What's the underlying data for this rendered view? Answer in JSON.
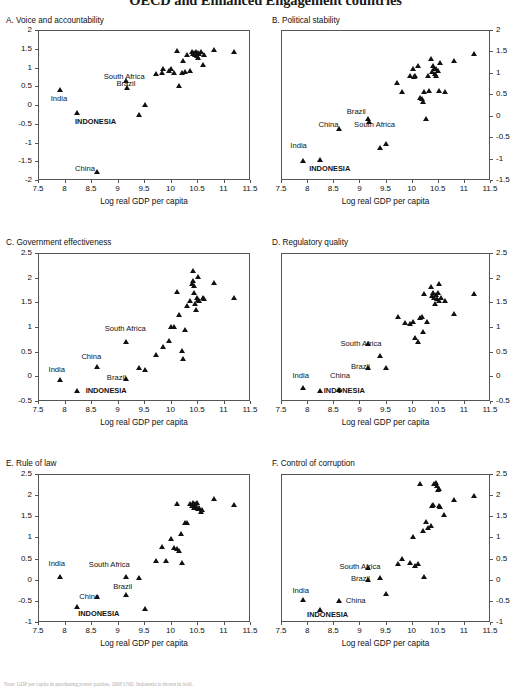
{
  "figure": {
    "title": "OECD and Enhanced Engagement countries",
    "note": "Note: GDP per capita in purchasing power parities, 2008 USD. Indonesia is shown in bold.",
    "xlabel": "Log real GDP per capita",
    "xlim": [
      7.5,
      11.5
    ],
    "xticks": [
      "7.5",
      "8",
      "8.5",
      "9",
      "9.5",
      "10",
      "10.5",
      "11",
      "11.5"
    ],
    "marker_color": "#111111"
  },
  "chart_data": [
    {
      "type": "scatter",
      "panel": "A",
      "title": "A. Voice and accountability",
      "xlabel": "Log real GDP per capita",
      "ylabel": "",
      "xlim": [
        7.5,
        11.5
      ],
      "ylim": [
        -2,
        2
      ],
      "yticks": [
        "-2",
        "-1.5",
        "-1",
        "-0.5",
        "0",
        "0.5",
        "1",
        "1.5",
        "2"
      ],
      "y_axis_side": "left",
      "grid": false,
      "legend": "none",
      "points": [
        [
          7.9,
          0.43
        ],
        [
          8.22,
          -0.17
        ],
        [
          8.6,
          -1.74
        ],
        [
          9.15,
          0.68
        ],
        [
          9.17,
          0.48
        ],
        [
          9.38,
          -0.22
        ],
        [
          9.5,
          0.03
        ],
        [
          9.7,
          0.85
        ],
        [
          9.82,
          0.88
        ],
        [
          9.85,
          1.0
        ],
        [
          9.95,
          0.95
        ],
        [
          10.0,
          1.0
        ],
        [
          10.05,
          0.88
        ],
        [
          10.1,
          1.47
        ],
        [
          10.15,
          0.55
        ],
        [
          10.2,
          0.9
        ],
        [
          10.22,
          1.2
        ],
        [
          10.25,
          0.92
        ],
        [
          10.3,
          1.36
        ],
        [
          10.35,
          0.93
        ],
        [
          10.38,
          1.45
        ],
        [
          10.4,
          1.4
        ],
        [
          10.42,
          1.43
        ],
        [
          10.45,
          1.38
        ],
        [
          10.47,
          1.45
        ],
        [
          10.48,
          1.35
        ],
        [
          10.5,
          1.42
        ],
        [
          10.5,
          1.3
        ],
        [
          10.52,
          1.39
        ],
        [
          10.55,
          1.44
        ],
        [
          10.6,
          1.1
        ],
        [
          10.62,
          1.36
        ],
        [
          10.8,
          1.5
        ],
        [
          11.18,
          1.46
        ]
      ],
      "annotations": [
        {
          "text": "India",
          "x": 7.72,
          "y": 0.18,
          "bold": false
        },
        {
          "text": "South Africa",
          "x": 8.72,
          "y": 0.77,
          "bold": false
        },
        {
          "text": "Brazil",
          "x": 8.96,
          "y": 0.58,
          "bold": false
        },
        {
          "text": "INDONESIA",
          "x": 8.18,
          "y": -0.42,
          "bold": true
        },
        {
          "text": "China",
          "x": 8.18,
          "y": -1.68,
          "bold": false
        }
      ]
    },
    {
      "type": "scatter",
      "panel": "B",
      "title": "B. Political stability",
      "xlabel": "Log real GDP per capita",
      "ylabel": "",
      "xlim": [
        7.5,
        11.5
      ],
      "ylim": [
        -1.5,
        2
      ],
      "yticks": [
        "-1.5",
        "-1",
        "-0.5",
        "0",
        "0.5",
        "1",
        "1.5",
        "2"
      ],
      "y_axis_side": "right",
      "grid": false,
      "legend": "none",
      "points": [
        [
          7.9,
          -1.02
        ],
        [
          8.22,
          -1.0
        ],
        [
          8.6,
          -0.27
        ],
        [
          9.15,
          -0.05
        ],
        [
          9.17,
          -0.12
        ],
        [
          9.38,
          -0.72
        ],
        [
          9.5,
          -0.64
        ],
        [
          9.7,
          0.8
        ],
        [
          9.8,
          0.58
        ],
        [
          9.95,
          0.95
        ],
        [
          10.0,
          1.12
        ],
        [
          10.02,
          0.93
        ],
        [
          10.05,
          0.95
        ],
        [
          10.1,
          1.2
        ],
        [
          10.15,
          0.45
        ],
        [
          10.18,
          0.42
        ],
        [
          10.2,
          0.35
        ],
        [
          10.22,
          0.58
        ],
        [
          10.25,
          -0.05
        ],
        [
          10.3,
          0.95
        ],
        [
          10.32,
          0.6
        ],
        [
          10.35,
          1.35
        ],
        [
          10.38,
          1.05
        ],
        [
          10.4,
          1.18
        ],
        [
          10.42,
          1.12
        ],
        [
          10.43,
          1.0
        ],
        [
          10.45,
          1.13
        ],
        [
          10.45,
          0.95
        ],
        [
          10.48,
          1.08
        ],
        [
          10.5,
          0.6
        ],
        [
          10.52,
          1.25
        ],
        [
          10.62,
          0.58
        ],
        [
          10.8,
          1.3
        ],
        [
          11.18,
          1.48
        ]
      ],
      "annotations": [
        {
          "text": "India",
          "x": 7.66,
          "y": -0.68,
          "bold": false
        },
        {
          "text": "China",
          "x": 8.2,
          "y": -0.2,
          "bold": false
        },
        {
          "text": "Brazil",
          "x": 8.74,
          "y": 0.12,
          "bold": false
        },
        {
          "text": "South Africa",
          "x": 8.88,
          "y": -0.2,
          "bold": false
        },
        {
          "text": "INDONESIA",
          "x": 8.02,
          "y": -1.22,
          "bold": true
        }
      ]
    },
    {
      "type": "scatter",
      "panel": "C",
      "title": "C. Government effectiveness",
      "xlabel": "Log real GDP per capita",
      "ylabel": "",
      "xlim": [
        7.5,
        11.5
      ],
      "ylim": [
        -0.5,
        2.5
      ],
      "yticks": [
        "-0.5",
        "0",
        "0.5",
        "1",
        "1.5",
        "2",
        "2.5"
      ],
      "y_axis_side": "left",
      "grid": false,
      "legend": "none",
      "points": [
        [
          7.9,
          -0.04
        ],
        [
          8.22,
          -0.28
        ],
        [
          8.6,
          0.22
        ],
        [
          9.15,
          0.73
        ],
        [
          9.15,
          -0.03
        ],
        [
          9.38,
          0.19
        ],
        [
          9.5,
          0.16
        ],
        [
          9.7,
          0.46
        ],
        [
          9.85,
          0.63
        ],
        [
          9.95,
          0.74
        ],
        [
          10.0,
          1.02
        ],
        [
          10.05,
          1.03
        ],
        [
          10.1,
          1.74
        ],
        [
          10.15,
          1.27
        ],
        [
          10.2,
          0.53
        ],
        [
          10.22,
          0.37
        ],
        [
          10.25,
          0.97
        ],
        [
          10.3,
          1.45
        ],
        [
          10.35,
          1.55
        ],
        [
          10.38,
          1.9
        ],
        [
          10.4,
          2.16
        ],
        [
          10.4,
          1.95
        ],
        [
          10.42,
          1.85
        ],
        [
          10.43,
          1.72
        ],
        [
          10.45,
          1.5
        ],
        [
          10.47,
          1.38
        ],
        [
          10.48,
          1.62
        ],
        [
          10.5,
          2.03
        ],
        [
          10.5,
          1.58
        ],
        [
          10.52,
          1.55
        ],
        [
          10.6,
          1.62
        ],
        [
          10.62,
          1.6
        ],
        [
          10.8,
          1.92
        ],
        [
          11.18,
          1.62
        ]
      ],
      "annotations": [
        {
          "text": "India",
          "x": 7.68,
          "y": 0.14,
          "bold": false
        },
        {
          "text": "China",
          "x": 8.3,
          "y": 0.42,
          "bold": false
        },
        {
          "text": "South Africa",
          "x": 8.74,
          "y": 0.97,
          "bold": false
        },
        {
          "text": "Brazil",
          "x": 8.78,
          "y": -0.02,
          "bold": false
        },
        {
          "text": "INDONESIA",
          "x": 8.38,
          "y": -0.27,
          "bold": true
        }
      ]
    },
    {
      "type": "scatter",
      "panel": "D",
      "title": "D. Regulatory quality",
      "xlabel": "Log real GDP per capita",
      "ylabel": "",
      "xlim": [
        7.5,
        11.5
      ],
      "ylim": [
        -0.5,
        2.5
      ],
      "yticks": [
        "-0.5",
        "0",
        "0.5",
        "1",
        "1.5",
        "2",
        "2.5"
      ],
      "y_axis_side": "right",
      "grid": false,
      "legend": "none",
      "points": [
        [
          7.9,
          -0.22
        ],
        [
          8.22,
          -0.27
        ],
        [
          8.6,
          -0.25
        ],
        [
          9.15,
          0.68
        ],
        [
          9.15,
          0.2
        ],
        [
          9.38,
          0.43
        ],
        [
          9.5,
          0.2
        ],
        [
          9.72,
          1.22
        ],
        [
          9.85,
          1.1
        ],
        [
          9.95,
          1.08
        ],
        [
          10.0,
          1.12
        ],
        [
          10.05,
          0.8
        ],
        [
          10.1,
          0.72
        ],
        [
          10.15,
          1.2
        ],
        [
          10.18,
          1.22
        ],
        [
          10.2,
          0.92
        ],
        [
          10.22,
          1.7
        ],
        [
          10.28,
          1.12
        ],
        [
          10.35,
          1.83
        ],
        [
          10.38,
          1.65
        ],
        [
          10.4,
          1.72
        ],
        [
          10.42,
          1.62
        ],
        [
          10.43,
          1.5
        ],
        [
          10.45,
          1.68
        ],
        [
          10.47,
          1.6
        ],
        [
          10.48,
          1.72
        ],
        [
          10.5,
          1.9
        ],
        [
          10.5,
          1.55
        ],
        [
          10.55,
          1.62
        ],
        [
          10.62,
          1.55
        ],
        [
          10.8,
          1.3
        ],
        [
          11.18,
          1.7
        ]
      ],
      "annotations": [
        {
          "text": "South Africa",
          "x": 8.62,
          "y": 0.68,
          "bold": false
        },
        {
          "text": "Brazil",
          "x": 8.82,
          "y": 0.21,
          "bold": false
        },
        {
          "text": "India",
          "x": 7.7,
          "y": 0.02,
          "bold": false
        },
        {
          "text": "China",
          "x": 8.42,
          "y": 0.02,
          "bold": false
        },
        {
          "text": "INDONESIA",
          "x": 8.3,
          "y": -0.27,
          "bold": true
        }
      ]
    },
    {
      "type": "scatter",
      "panel": "E",
      "title": "E. Rule of law",
      "xlabel": "Log real GDP per capita",
      "ylabel": "",
      "xlim": [
        7.5,
        11.5
      ],
      "ylim": [
        -1,
        2.5
      ],
      "yticks": [
        "-1",
        "-0.5",
        "0",
        "0.5",
        "1",
        "1.5",
        "2",
        "2.5"
      ],
      "y_axis_side": "left",
      "grid": false,
      "legend": "none",
      "points": [
        [
          7.9,
          0.1
        ],
        [
          8.22,
          -0.62
        ],
        [
          8.6,
          -0.37
        ],
        [
          9.15,
          0.09
        ],
        [
          9.15,
          -0.33
        ],
        [
          9.38,
          0.06
        ],
        [
          9.5,
          -0.66
        ],
        [
          9.7,
          0.47
        ],
        [
          9.82,
          0.8
        ],
        [
          9.9,
          0.47
        ],
        [
          10.0,
          1.0
        ],
        [
          10.05,
          0.78
        ],
        [
          10.1,
          0.75
        ],
        [
          10.1,
          1.83
        ],
        [
          10.15,
          0.72
        ],
        [
          10.18,
          1.12
        ],
        [
          10.2,
          0.43
        ],
        [
          10.25,
          1.37
        ],
        [
          10.3,
          1.38
        ],
        [
          10.35,
          1.82
        ],
        [
          10.38,
          1.78
        ],
        [
          10.4,
          1.85
        ],
        [
          10.42,
          1.8
        ],
        [
          10.43,
          1.73
        ],
        [
          10.45,
          1.82
        ],
        [
          10.47,
          1.76
        ],
        [
          10.48,
          1.85
        ],
        [
          10.5,
          1.7
        ],
        [
          10.52,
          1.72
        ],
        [
          10.55,
          1.63
        ],
        [
          10.58,
          1.68
        ],
        [
          10.8,
          1.95
        ],
        [
          11.18,
          1.8
        ]
      ],
      "annotations": [
        {
          "text": "India",
          "x": 7.68,
          "y": 0.4,
          "bold": false
        },
        {
          "text": "South Africa",
          "x": 8.44,
          "y": 0.38,
          "bold": false
        },
        {
          "text": "Brazil",
          "x": 8.9,
          "y": -0.15,
          "bold": false
        },
        {
          "text": "China",
          "x": 8.26,
          "y": -0.38,
          "bold": false
        },
        {
          "text": "INDONESIA",
          "x": 8.24,
          "y": -0.78,
          "bold": true
        }
      ]
    },
    {
      "type": "scatter",
      "panel": "F",
      "title": "F. Control of corruption",
      "xlabel": "Log real GDP per capita",
      "ylabel": "",
      "xlim": [
        7.5,
        11.5
      ],
      "ylim": [
        -1,
        2.5
      ],
      "yticks": [
        "-1",
        "-0.5",
        "0",
        "0.5",
        "1",
        "1.5",
        "2",
        "2.5"
      ],
      "y_axis_side": "right",
      "grid": false,
      "legend": "none",
      "points": [
        [
          7.9,
          -0.45
        ],
        [
          8.22,
          -0.68
        ],
        [
          8.6,
          -0.48
        ],
        [
          9.15,
          0.3
        ],
        [
          9.15,
          0.02
        ],
        [
          9.38,
          0.08
        ],
        [
          9.5,
          -0.3
        ],
        [
          9.72,
          0.4
        ],
        [
          9.8,
          0.52
        ],
        [
          9.95,
          0.42
        ],
        [
          10.0,
          1.05
        ],
        [
          10.05,
          0.35
        ],
        [
          10.1,
          0.4
        ],
        [
          10.15,
          2.3
        ],
        [
          10.2,
          1.18
        ],
        [
          10.22,
          0.1
        ],
        [
          10.25,
          1.4
        ],
        [
          10.3,
          1.25
        ],
        [
          10.35,
          1.3
        ],
        [
          10.38,
          1.78
        ],
        [
          10.4,
          1.8
        ],
        [
          10.42,
          2.3
        ],
        [
          10.45,
          2.32
        ],
        [
          10.47,
          2.25
        ],
        [
          10.48,
          2.15
        ],
        [
          10.5,
          2.18
        ],
        [
          10.5,
          1.78
        ],
        [
          10.52,
          1.75
        ],
        [
          10.6,
          1.55
        ],
        [
          10.8,
          1.92
        ],
        [
          11.18,
          2.0
        ]
      ],
      "annotations": [
        {
          "text": "South Africa",
          "x": 8.6,
          "y": 0.32,
          "bold": false
        },
        {
          "text": "Brazil",
          "x": 8.82,
          "y": 0.03,
          "bold": false
        },
        {
          "text": "India",
          "x": 7.7,
          "y": -0.25,
          "bold": false
        },
        {
          "text": "China",
          "x": 8.72,
          "y": -0.48,
          "bold": false
        },
        {
          "text": "INDONESIA",
          "x": 7.98,
          "y": -0.82,
          "bold": true
        }
      ]
    }
  ]
}
